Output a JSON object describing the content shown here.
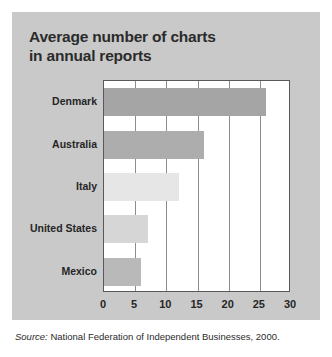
{
  "figure": {
    "panel_bg": "#c9c9c9",
    "page_bg": "#ffffff",
    "title_line1": "Average number of charts",
    "title_line2": "in annual reports",
    "title_color": "#2b2b2b"
  },
  "source": {
    "label": "Source:",
    "text": " National Federation of Independent Businesses, 2000."
  },
  "chart_data": {
    "type": "bar",
    "orientation": "horizontal",
    "title": "Average number of charts in annual reports",
    "xlabel": "",
    "ylabel": "",
    "categories": [
      "Denmark",
      "Australia",
      "Italy",
      "United States",
      "Mexico"
    ],
    "values": [
      26,
      16,
      12,
      7,
      6
    ],
    "bar_colors": [
      "#a5a5a5",
      "#adadad",
      "#e6e6e6",
      "#d6d6d6",
      "#b9b9b9"
    ],
    "xlim": [
      0,
      30
    ],
    "xticks": [
      0,
      5,
      10,
      15,
      20,
      25,
      30
    ],
    "xtick_labels": [
      "0",
      "5",
      "10",
      "15",
      "20",
      "25",
      "30"
    ],
    "grid": "vertical",
    "legend": "none",
    "axis_color": "#58595b",
    "gridline_color": "#8a8c8e",
    "plot_bg": "#ffffff"
  }
}
